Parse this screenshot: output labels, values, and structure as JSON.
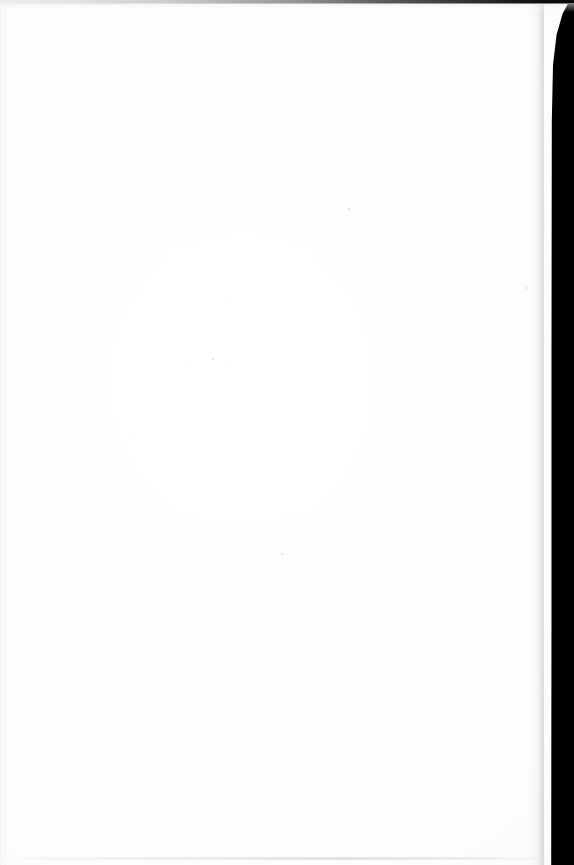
{
  "document": {
    "kind": "scanned-page",
    "page_content_text": "",
    "page_is_blank": true,
    "width_px": 574,
    "height_px": 865
  },
  "colors": {
    "paper_white": "#FEFEFF",
    "scanner_bed_black": "#000000",
    "top_band_gray": "#808085",
    "edge_artifact_gray": "#E4E4E8",
    "noise_speck_gray": "#C4C4CE"
  },
  "regions": {
    "page_sheet": {
      "label": "",
      "x": 0,
      "y": 0,
      "width": 552,
      "height": 865
    },
    "scanner_bed_right": {
      "label": "",
      "x": 552,
      "y": 0,
      "width": 22,
      "height": 865
    },
    "scanner_bed_top": {
      "label": "",
      "x": 0,
      "y": 0,
      "width": 574,
      "height": 4
    },
    "left_edge_banding": {
      "label": "",
      "x": 0,
      "y": 0,
      "width": 10,
      "height": 865
    },
    "bottom_edge_line": {
      "label": "",
      "x": 0,
      "y": 857,
      "width": 552,
      "height": 3
    }
  },
  "noise_specks": [
    {
      "x": 212,
      "y": 358,
      "size": 2
    },
    {
      "x": 228,
      "y": 365,
      "size": 1
    },
    {
      "x": 186,
      "y": 366,
      "size": 1
    },
    {
      "x": 348,
      "y": 208,
      "size": 2
    },
    {
      "x": 355,
      "y": 210,
      "size": 1
    },
    {
      "x": 96,
      "y": 102,
      "size": 1
    },
    {
      "x": 253,
      "y": 84,
      "size": 1
    },
    {
      "x": 197,
      "y": 64,
      "size": 1
    },
    {
      "x": 351,
      "y": 196,
      "size": 1
    },
    {
      "x": 503,
      "y": 290,
      "size": 1
    },
    {
      "x": 526,
      "y": 287,
      "size": 2
    },
    {
      "x": 533,
      "y": 292,
      "size": 1
    },
    {
      "x": 135,
      "y": 437,
      "size": 1
    },
    {
      "x": 340,
      "y": 688,
      "size": 1
    },
    {
      "x": 424,
      "y": 694,
      "size": 1
    },
    {
      "x": 281,
      "y": 553,
      "size": 2
    },
    {
      "x": 60,
      "y": 63,
      "size": 1
    },
    {
      "x": 145,
      "y": 62,
      "size": 1
    },
    {
      "x": 380,
      "y": 140,
      "size": 1
    },
    {
      "x": 497,
      "y": 130,
      "size": 1
    },
    {
      "x": 375,
      "y": 726,
      "size": 1
    },
    {
      "x": 168,
      "y": 819,
      "size": 1
    },
    {
      "x": 312,
      "y": 746,
      "size": 1
    },
    {
      "x": 84,
      "y": 594,
      "size": 1
    },
    {
      "x": 460,
      "y": 462,
      "size": 1
    },
    {
      "x": 231,
      "y": 300,
      "size": 1
    },
    {
      "x": 290,
      "y": 628,
      "size": 1
    },
    {
      "x": 119,
      "y": 250,
      "size": 1
    }
  ]
}
